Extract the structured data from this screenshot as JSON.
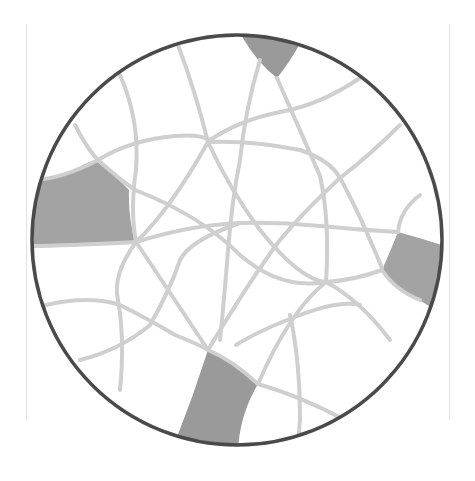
{
  "diagram": {
    "type": "circle-network",
    "circle": {
      "cx": 237,
      "cy": 240,
      "r": 205,
      "stroke": "#4a4a4a",
      "stroke_width": 3.5
    },
    "colors": {
      "background": "#ffffff",
      "network_line": "#cfcfcf",
      "shaded_region": "#9a9a9a",
      "shaded_region_light": "#a6a6a6",
      "circle_outline": "#4a4a4a",
      "frame_line": "#e2e2e2"
    },
    "shaded_regions": [
      {
        "id": "top-region",
        "label": ""
      },
      {
        "id": "left-region",
        "label": ""
      },
      {
        "id": "right-region",
        "label": ""
      },
      {
        "id": "bottom-region",
        "label": ""
      }
    ]
  }
}
